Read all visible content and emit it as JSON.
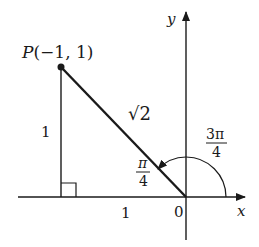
{
  "diagram": {
    "type": "coordinate-plane-angle",
    "colors": {
      "stroke": "#1a1a1a",
      "background": "#ffffff"
    },
    "axes": {
      "x_label": "x",
      "y_label": "y",
      "origin_label": "0"
    },
    "point": {
      "name": "P",
      "coords_text": "(−1, 1)",
      "x": -1,
      "y": 1
    },
    "segments": {
      "hypotenuse_label": "√2",
      "vertical_label": "1",
      "horizontal_label": "1"
    },
    "angles": {
      "reference": {
        "num": "π",
        "den": "4"
      },
      "standard": {
        "num": "3π",
        "den": "4"
      }
    },
    "right_angle_marker": true
  }
}
